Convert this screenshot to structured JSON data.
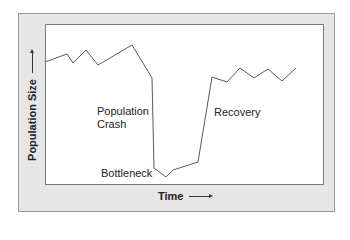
{
  "chart_data": {
    "type": "line",
    "title": "",
    "xlabel": "Time",
    "ylabel": "Population Size",
    "axis_arrows": true,
    "grid": false,
    "ticks": "none",
    "series": [
      {
        "name": "Population",
        "points_px": [
          [
            45,
            62
          ],
          [
            67,
            54
          ],
          [
            73,
            63
          ],
          [
            86,
            50
          ],
          [
            98,
            65
          ],
          [
            132,
            45
          ],
          [
            152,
            78
          ],
          [
            154,
            168
          ],
          [
            166,
            177
          ],
          [
            173,
            170
          ],
          [
            198,
            162
          ],
          [
            212,
            77
          ],
          [
            227,
            82
          ],
          [
            240,
            68
          ],
          [
            254,
            78
          ],
          [
            268,
            69
          ],
          [
            282,
            81
          ],
          [
            296,
            68
          ]
        ],
        "relative_values": [
          0.77,
          0.82,
          0.76,
          0.84,
          0.75,
          0.87,
          0.66,
          0.11,
          0.05,
          0.09,
          0.14,
          0.67,
          0.64,
          0.73,
          0.66,
          0.72,
          0.65,
          0.73
        ]
      }
    ],
    "annotations": [
      {
        "text": "Population Crash",
        "phase": "crash"
      },
      {
        "text": "Bottleneck",
        "phase": "minimum"
      },
      {
        "text": "Recovery",
        "phase": "recovery"
      }
    ]
  },
  "labels": {
    "crash_line1": "Population",
    "crash_line2": "Crash",
    "bottleneck": "Bottleneck",
    "recovery": "Recovery",
    "x_axis": "Time",
    "y_axis": "Population Size"
  },
  "style": {
    "line_color": "#5a5a5a",
    "frame_color": "#e6e6e6"
  }
}
